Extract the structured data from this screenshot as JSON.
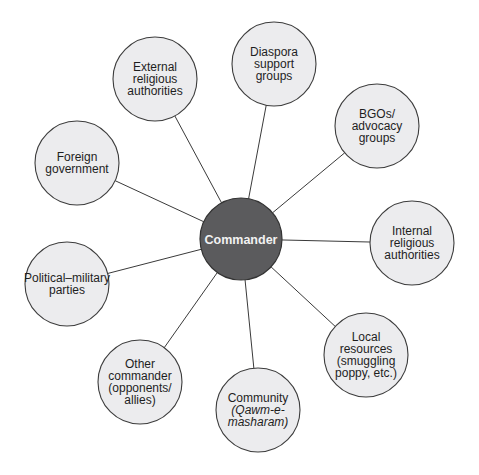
{
  "diagram": {
    "type": "hub-and-spoke",
    "center": {
      "id": "commander",
      "label": "Commander",
      "fill": "#5b5b5d",
      "text_color": "#f2f2f2"
    },
    "node_fill": "#ececee",
    "line_color": "#3a3a3a",
    "nodes": [
      {
        "id": "external-religious-authorities",
        "lines": [
          {
            "text": "External"
          },
          {
            "text": "religious"
          },
          {
            "text": "authorities"
          }
        ]
      },
      {
        "id": "diaspora-support-groups",
        "lines": [
          {
            "text": "Diaspora"
          },
          {
            "text": "support"
          },
          {
            "text": "groups"
          }
        ]
      },
      {
        "id": "bgos-advocacy-groups",
        "lines": [
          {
            "text": "BGOs/"
          },
          {
            "text": "advocacy"
          },
          {
            "text": "groups"
          }
        ]
      },
      {
        "id": "internal-religious-authorities",
        "lines": [
          {
            "text": "Internal"
          },
          {
            "text": "religious"
          },
          {
            "text": "authorities"
          }
        ]
      },
      {
        "id": "local-resources",
        "lines": [
          {
            "text": "Local"
          },
          {
            "text": "resources"
          },
          {
            "text": "(smuggling"
          },
          {
            "text": "poppy, etc.)"
          }
        ]
      },
      {
        "id": "community",
        "lines": [
          {
            "text": "Community"
          },
          {
            "text": "(Qawm-e-",
            "italic": true
          },
          {
            "text": "masharam)",
            "italic": true
          }
        ]
      },
      {
        "id": "other-commander",
        "lines": [
          {
            "text": "Other"
          },
          {
            "text": "commander"
          },
          {
            "text": "(opponents/"
          },
          {
            "text": "allies)"
          }
        ]
      },
      {
        "id": "political-military-parties",
        "lines": [
          {
            "text": "Political–military"
          },
          {
            "text": "parties"
          }
        ]
      },
      {
        "id": "foreign-government",
        "lines": [
          {
            "text": "Foreign"
          },
          {
            "text": "government"
          }
        ]
      }
    ],
    "edges": [
      [
        "commander",
        "external-religious-authorities"
      ],
      [
        "commander",
        "diaspora-support-groups"
      ],
      [
        "commander",
        "bgos-advocacy-groups"
      ],
      [
        "commander",
        "internal-religious-authorities"
      ],
      [
        "commander",
        "local-resources"
      ],
      [
        "commander",
        "community"
      ],
      [
        "commander",
        "other-commander"
      ],
      [
        "commander",
        "political-military-parties"
      ],
      [
        "commander",
        "foreign-government"
      ]
    ]
  }
}
